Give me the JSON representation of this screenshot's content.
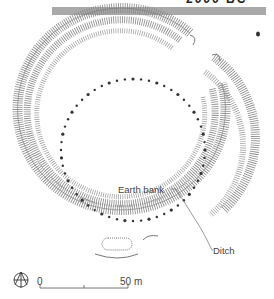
{
  "header": {
    "title_fragment": "2000 BC",
    "bar_color": "#a9a9a9"
  },
  "diagram": {
    "labels": {
      "earth_bank": "Earth bank",
      "ditch": "Ditch"
    },
    "features": [
      "outer ditch ring",
      "earth bank ring",
      "inner ring of post holes",
      "entrance gaps"
    ]
  },
  "scale_bar": {
    "start_label": "0",
    "end_label": "50 m"
  },
  "icons": {
    "north_arrow": "compass-north-icon"
  },
  "colors": {
    "line": "#555555",
    "dots": "#333333"
  }
}
